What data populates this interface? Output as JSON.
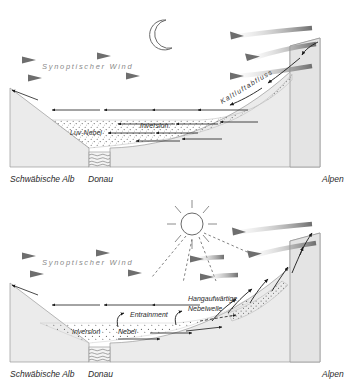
{
  "figure": {
    "width": 362,
    "height": 390
  },
  "colors": {
    "terrain_fill": "#ebebeb",
    "terrain_stroke": "#9a9a9a",
    "wind_arrow": "#8c8c8c",
    "thin_arrow": "#1a1a1a",
    "fog_stipple": "#707070",
    "label_text": "#2b2b2b",
    "wind_label": "#8a8a8a"
  },
  "panels": [
    {
      "id": "night",
      "name": "night-panel",
      "celestial": "moon-icon",
      "labels": {
        "synoptic_wind": "Synoptischer Wind",
        "cold_air_drainage": "Kaltluftabfluss",
        "upwind_fog": "Luv-Nebel",
        "inversion": "Inversion"
      },
      "ground_labels": {
        "left": "Schwäbische Alb",
        "river": "Donau",
        "right": "Alpen"
      }
    },
    {
      "id": "day",
      "name": "day-panel",
      "celestial": "sun-icon",
      "labels": {
        "synoptic_wind": "Synoptischer Wind",
        "upslope_fog_wave_line1": "Hangaufwärtige",
        "upslope_fog_wave_line2": "Nebelwelle",
        "entrainment": "Entrainment",
        "inversion": "Inversion",
        "fog": "Nebel"
      },
      "ground_labels": {
        "left": "Schwäbische Alb",
        "river": "Donau",
        "right": "Alpen"
      }
    }
  ]
}
